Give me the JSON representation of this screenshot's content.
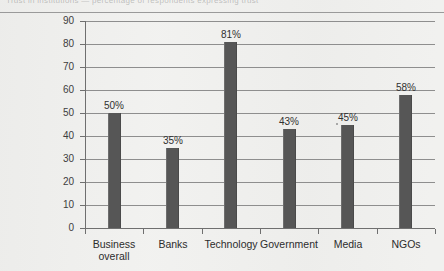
{
  "caption": {
    "text": "Trust in institutions — percentage of respondents expressing trust"
  },
  "chart_data": {
    "type": "bar",
    "title": "",
    "subtitle": "",
    "xlabel": "",
    "ylabel": "",
    "categories": [
      "Business overall",
      "Banks",
      "Technology",
      "Government",
      "Media",
      "NGOs"
    ],
    "category_lines": [
      [
        "Business",
        "overall"
      ],
      [
        "Banks"
      ],
      [
        "Technology"
      ],
      [
        "Government"
      ],
      [
        "Media"
      ],
      [
        "NGOs"
      ]
    ],
    "values": [
      50,
      35,
      81,
      43,
      45,
      58
    ],
    "data_labels": [
      "50%",
      "35%",
      "81%",
      "43%",
      "45%",
      "58%"
    ],
    "ylim": [
      0,
      90
    ],
    "ytick_step": 10,
    "yticks": [
      0,
      10,
      20,
      30,
      40,
      50,
      60,
      70,
      80,
      90
    ],
    "ytick_labels": [
      "0",
      "10",
      "20",
      "30",
      "40",
      "50",
      "60",
      "70",
      "80",
      "90"
    ],
    "grid": true,
    "grid_axis": "y",
    "legend": false,
    "legend_position": "none",
    "series": [
      {
        "name": "Trust",
        "color": "#565656",
        "values": [
          50,
          35,
          81,
          43,
          45,
          58
        ]
      }
    ]
  },
  "colors": {
    "bar": "#565656",
    "grid": "#8e8e8e",
    "axis": "#6f6f6f",
    "text": "#2c2c2c",
    "background": "#f1f1ef"
  }
}
